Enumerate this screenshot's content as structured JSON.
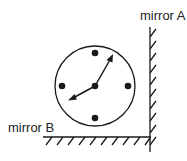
{
  "labels": {
    "mirror_a": "mirror A",
    "mirror_b": "mirror B"
  },
  "clock": {
    "center": [
      95,
      86
    ],
    "radius": 40,
    "hour_marks": 4,
    "hands": 2
  },
  "colors": {
    "stroke": "#1a1a1a"
  }
}
